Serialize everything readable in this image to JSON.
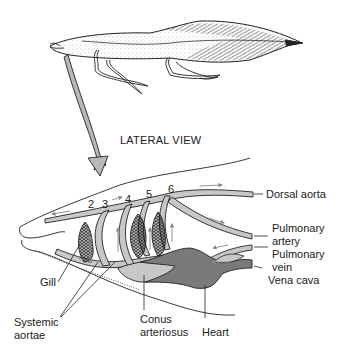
{
  "diagram": {
    "title": "LATERAL VIEW",
    "arch_numbers": [
      "2",
      "3",
      "4",
      "5",
      "6"
    ],
    "labels": {
      "dorsal_aorta": "Dorsal aorta",
      "pulmonary_artery_1": "Pulmonary",
      "pulmonary_artery_2": "artery",
      "pulmonary_vein_1": "Pulmonary",
      "pulmonary_vein_2": "vein",
      "vena_cava": "Vena cava",
      "gill": "Gill",
      "systemic_aortae_1": "Systemic",
      "systemic_aortae_2": "aortae",
      "conus_1": "Conus",
      "conus_2": "arteriosus",
      "heart": "Heart"
    },
    "colors": {
      "vessel_fill": "#c8c8c8",
      "heart_fill": "#7a7a7a",
      "line": "#1a1a1a",
      "arrow_fill": "#b5b5b5"
    }
  }
}
